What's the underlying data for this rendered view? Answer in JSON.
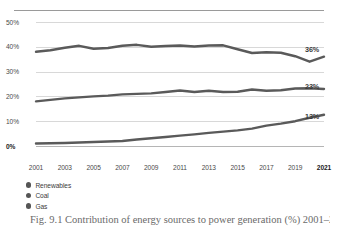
{
  "figure": {
    "caption": "Fig. 9.1 Contribution of energy sources to power generation (%) 2001–2021"
  },
  "axis": {
    "y_ticks": [
      "50%",
      "40%",
      "30%",
      "20%",
      "10%",
      "0%"
    ],
    "x_ticks": [
      "2001",
      "2003",
      "2005",
      "2007",
      "2009",
      "2011",
      "2013",
      "2015",
      "2017",
      "2019",
      "2021"
    ],
    "current_year": "2021"
  },
  "end_labels": {
    "coal": "36%",
    "gas": "23%",
    "renewables": "13%"
  },
  "legend": {
    "items": [
      {
        "label": "Renewables",
        "color": "#555555"
      },
      {
        "label": "Coal",
        "color": "#555555"
      },
      {
        "label": "Gas",
        "color": "#555555"
      }
    ]
  },
  "colors": {
    "line": "#5a5a5a",
    "grid": "#d8d8d8",
    "axis": "#b5b5b5",
    "text": "#3a3a3a"
  },
  "chart_data": {
    "type": "line",
    "title": "",
    "xlabel": "",
    "ylabel": "",
    "ylim": [
      0,
      50
    ],
    "xlim": [
      2001,
      2021
    ],
    "grid": true,
    "legend_position": "bottom-left",
    "x": [
      2001,
      2002,
      2003,
      2004,
      2005,
      2006,
      2007,
      2008,
      2009,
      2010,
      2011,
      2012,
      2013,
      2014,
      2015,
      2016,
      2017,
      2018,
      2019,
      2020,
      2021
    ],
    "series": [
      {
        "name": "Coal",
        "end_label": "36%",
        "values": [
          38.0,
          38.6,
          39.6,
          40.4,
          39.2,
          39.5,
          40.4,
          40.8,
          40.0,
          40.3,
          40.5,
          40.1,
          40.5,
          40.6,
          39.0,
          37.5,
          37.8,
          37.6,
          36.2,
          34.0,
          36.0
        ]
      },
      {
        "name": "Gas",
        "end_label": "23%",
        "values": [
          18.0,
          18.6,
          19.2,
          19.6,
          20.0,
          20.3,
          20.8,
          21.0,
          21.2,
          21.8,
          22.4,
          21.8,
          22.3,
          21.8,
          21.9,
          22.8,
          22.3,
          22.5,
          23.2,
          23.3,
          23.0
        ]
      },
      {
        "name": "Renewables",
        "end_label": "13%",
        "values": [
          1.0,
          1.1,
          1.2,
          1.4,
          1.6,
          1.8,
          2.0,
          2.6,
          3.1,
          3.6,
          4.2,
          4.7,
          5.3,
          5.8,
          6.3,
          7.0,
          8.2,
          9.0,
          10.0,
          11.4,
          12.6
        ]
      }
    ]
  }
}
